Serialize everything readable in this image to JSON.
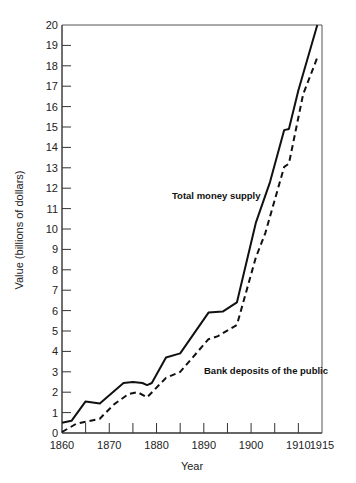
{
  "chart_data": {
    "type": "line",
    "title": "",
    "xlabel": "Year",
    "ylabel": "Value (billions of dollars)",
    "xlim": [
      1860,
      1915
    ],
    "ylim": [
      0,
      20
    ],
    "x_ticks": [
      1860,
      1870,
      1880,
      1890,
      1900,
      1910,
      1915
    ],
    "x_minor_ticks": [
      1865,
      1875,
      1885,
      1895,
      1905
    ],
    "y_ticks": [
      0,
      1,
      2,
      3,
      4,
      5,
      6,
      7,
      8,
      9,
      10,
      11,
      12,
      13,
      14,
      15,
      16,
      17,
      18,
      19,
      20
    ],
    "grid": false,
    "legend": "inline labels",
    "series": [
      {
        "name": "Total money supply",
        "style": "solid",
        "label_pos": [
          172,
          199
        ],
        "points": [
          [
            1860,
            0.5
          ],
          [
            1862,
            0.6
          ],
          [
            1865,
            1.55
          ],
          [
            1868,
            1.45
          ],
          [
            1873,
            2.45
          ],
          [
            1875,
            2.5
          ],
          [
            1877,
            2.45
          ],
          [
            1878,
            2.35
          ],
          [
            1879,
            2.45
          ],
          [
            1882,
            3.7
          ],
          [
            1885,
            3.9
          ],
          [
            1891,
            5.9
          ],
          [
            1894,
            5.95
          ],
          [
            1897,
            6.4
          ],
          [
            1901,
            10.3
          ],
          [
            1904,
            12.3
          ],
          [
            1907,
            14.85
          ],
          [
            1908,
            14.9
          ],
          [
            1910,
            16.8
          ],
          [
            1914,
            20.0
          ]
        ]
      },
      {
        "name": "Bank deposits of the public",
        "style": "dashed",
        "label_pos": [
          204,
          374
        ],
        "points": [
          [
            1860,
            0.05
          ],
          [
            1863,
            0.45
          ],
          [
            1868,
            0.7
          ],
          [
            1871,
            1.4
          ],
          [
            1874,
            1.9
          ],
          [
            1876,
            2.0
          ],
          [
            1878,
            1.75
          ],
          [
            1882,
            2.7
          ],
          [
            1885,
            3.0
          ],
          [
            1891,
            4.6
          ],
          [
            1893,
            4.75
          ],
          [
            1897,
            5.3
          ],
          [
            1901,
            8.6
          ],
          [
            1903,
            9.8
          ],
          [
            1907,
            13.05
          ],
          [
            1908,
            13.2
          ],
          [
            1911,
            16.6
          ],
          [
            1914,
            18.4
          ]
        ]
      }
    ]
  }
}
